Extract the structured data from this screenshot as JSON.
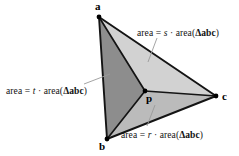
{
  "figure": {
    "background_color": "#ffffff",
    "edge_color": "#111111",
    "leader_color": "#9a9a9a"
  },
  "vertices": [
    {
      "name": "a",
      "label": "a",
      "x": 99,
      "y": 17
    },
    {
      "name": "b",
      "label": "b",
      "x": 107,
      "y": 139
    },
    {
      "name": "c",
      "label": "c",
      "x": 216,
      "y": 96
    },
    {
      "name": "p",
      "label": "p",
      "x": 145,
      "y": 91
    }
  ],
  "regions": [
    {
      "name": "region-t",
      "triangle": "apb",
      "coefficient": "t",
      "fill": "#8d8d8d",
      "label": {
        "prefix": "area",
        "equals": "=",
        "coefficient": "t",
        "operator": "·",
        "func_open": "area(",
        "delta": "Δ",
        "triangle_name": "abc",
        "func_close": ")"
      }
    },
    {
      "name": "region-s",
      "triangle": "apc",
      "coefficient": "s",
      "fill": "#d2d2d2",
      "label": {
        "prefix": "area",
        "equals": "=",
        "coefficient": "s",
        "operator": "·",
        "func_open": "area(",
        "delta": "Δ",
        "triangle_name": "abc",
        "func_close": ")"
      }
    },
    {
      "name": "region-r",
      "triangle": "bpc",
      "coefficient": "r",
      "fill": "#bbbbbb",
      "label": {
        "prefix": "area",
        "equals": "=",
        "coefficient": "r",
        "operator": "·",
        "func_open": "area(",
        "delta": "Δ",
        "triangle_name": "abc",
        "func_close": ")"
      }
    }
  ]
}
